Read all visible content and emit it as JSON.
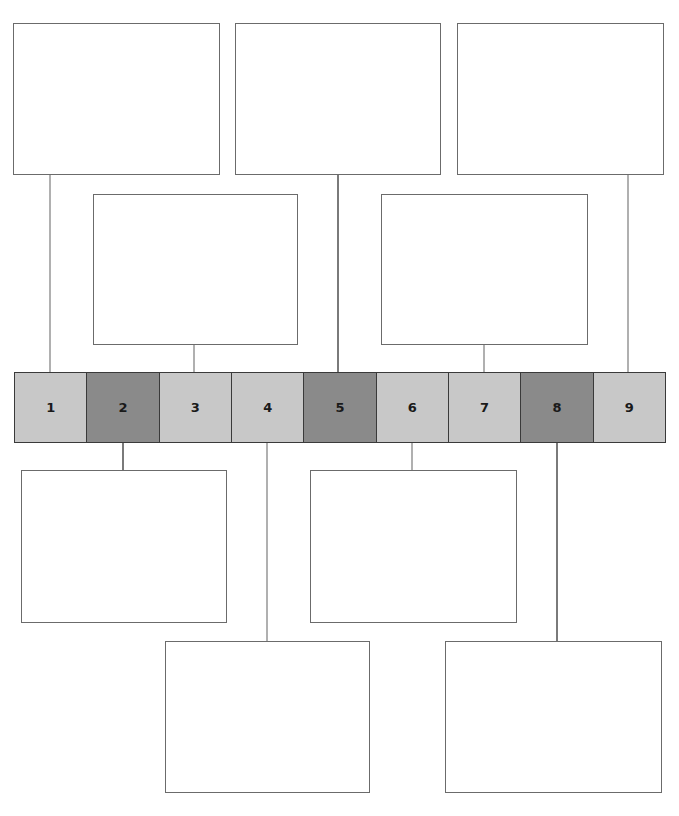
{
  "diagram": {
    "type": "numbered-strip-with-callout-boxes",
    "colors": {
      "light_cell": "#c8c8c8",
      "dark_cell": "#8a8a8a",
      "box_border": "#6b6b6b"
    },
    "cells": [
      {
        "label": "1",
        "shade": "light"
      },
      {
        "label": "2",
        "shade": "dark"
      },
      {
        "label": "3",
        "shade": "light"
      },
      {
        "label": "4",
        "shade": "light"
      },
      {
        "label": "5",
        "shade": "dark"
      },
      {
        "label": "6",
        "shade": "light"
      },
      {
        "label": "7",
        "shade": "light"
      },
      {
        "label": "8",
        "shade": "dark"
      },
      {
        "label": "9",
        "shade": "light"
      }
    ],
    "boxes": [
      {
        "id": "box-cell-1",
        "text": ""
      },
      {
        "id": "box-cell-5",
        "text": ""
      },
      {
        "id": "box-cell-9",
        "text": ""
      },
      {
        "id": "box-cell-3",
        "text": ""
      },
      {
        "id": "box-cell-7",
        "text": ""
      },
      {
        "id": "box-cell-2",
        "text": ""
      },
      {
        "id": "box-cell-6",
        "text": ""
      },
      {
        "id": "box-cell-4",
        "text": ""
      },
      {
        "id": "box-cell-8",
        "text": ""
      }
    ]
  }
}
